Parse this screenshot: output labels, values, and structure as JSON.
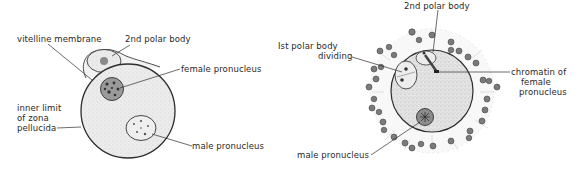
{
  "figure": {
    "left_panel": {
      "name": "fertilized egg - pronuclei stage",
      "labels": {
        "vitelline_membrane": "vitelline membrane",
        "second_polar_body": "2nd polar body",
        "female_pronucleus": "female pronucleus",
        "inner_limit_line1": "inner limit",
        "inner_limit_line2": "of  zona",
        "inner_limit_line3": "pellucida",
        "male_pronucleus": "male pronucleus"
      }
    },
    "right_panel": {
      "name": "fertilized egg with corona cells",
      "labels": {
        "second_polar_body": "2nd polar body",
        "first_polar_body_line1": "Ist polar body",
        "first_polar_body_line2": "dividing",
        "chromatin_line1": "chromatin of",
        "chromatin_line2": "female",
        "chromatin_line3": "pronucleus",
        "male_pronucleus": "male pronucleus"
      }
    },
    "colors": {
      "ink": "#2a2a2a",
      "cytoplasm": "#e6e6e6",
      "nucleus_dark": "#555555",
      "cell_fill": "#8a8a8a"
    }
  }
}
